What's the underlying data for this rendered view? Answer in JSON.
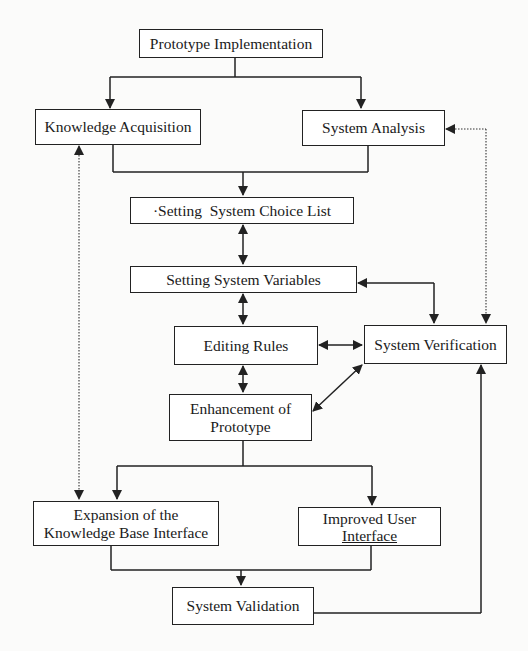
{
  "diagram": {
    "type": "flowchart",
    "nodes": [
      {
        "id": "prototype_implementation",
        "label": "Prototype Implementation"
      },
      {
        "id": "knowledge_acquisition",
        "label": "Knowledge Acquisition"
      },
      {
        "id": "system_analysis",
        "label": "System Analysis"
      },
      {
        "id": "setting_choice_list",
        "label": "·Setting  System Choice List"
      },
      {
        "id": "setting_variables",
        "label": "Setting System Variables"
      },
      {
        "id": "editing_rules",
        "label": "Editing Rules"
      },
      {
        "id": "system_verification",
        "label": "System Verification"
      },
      {
        "id": "enhancement",
        "label_line1": "Enhancement of",
        "label_line2": "Prototype"
      },
      {
        "id": "expansion_kb",
        "label_line1": "Expansion of the",
        "label_line2": "Knowledge Base Interface"
      },
      {
        "id": "improved_ui",
        "label_line1": "Improved User",
        "label_line2": "Interface"
      },
      {
        "id": "system_validation",
        "label": "System Validation"
      }
    ],
    "edges": [
      {
        "from": "prototype_implementation",
        "to": "knowledge_acquisition",
        "style": "arrow"
      },
      {
        "from": "prototype_implementation",
        "to": "system_analysis",
        "style": "arrow"
      },
      {
        "from": "knowledge_acquisition",
        "to": "setting_choice_list",
        "style": "arrow (merged)"
      },
      {
        "from": "system_analysis",
        "to": "setting_choice_list",
        "style": "arrow (merged)"
      },
      {
        "from": "setting_choice_list",
        "to": "setting_variables",
        "style": "bidirectional"
      },
      {
        "from": "setting_variables",
        "to": "editing_rules",
        "style": "bidirectional"
      },
      {
        "from": "setting_variables",
        "to": "system_verification",
        "style": "bidirectional"
      },
      {
        "from": "editing_rules",
        "to": "system_verification",
        "style": "bidirectional"
      },
      {
        "from": "editing_rules",
        "to": "enhancement",
        "style": "bidirectional"
      },
      {
        "from": "enhancement",
        "to": "system_verification",
        "style": "bidirectional"
      },
      {
        "from": "system_analysis",
        "to": "system_verification",
        "style": "bidirectional (dotted)"
      },
      {
        "from": "knowledge_acquisition",
        "to": "expansion_kb",
        "style": "bidirectional (dotted)"
      },
      {
        "from": "enhancement",
        "to": "expansion_kb",
        "style": "arrow"
      },
      {
        "from": "enhancement",
        "to": "improved_ui",
        "style": "arrow"
      },
      {
        "from": "expansion_kb",
        "to": "system_validation",
        "style": "arrow (merged)"
      },
      {
        "from": "improved_ui",
        "to": "system_validation",
        "style": "arrow (merged)"
      },
      {
        "from": "system_validation",
        "to": "system_verification",
        "style": "arrow"
      }
    ]
  }
}
